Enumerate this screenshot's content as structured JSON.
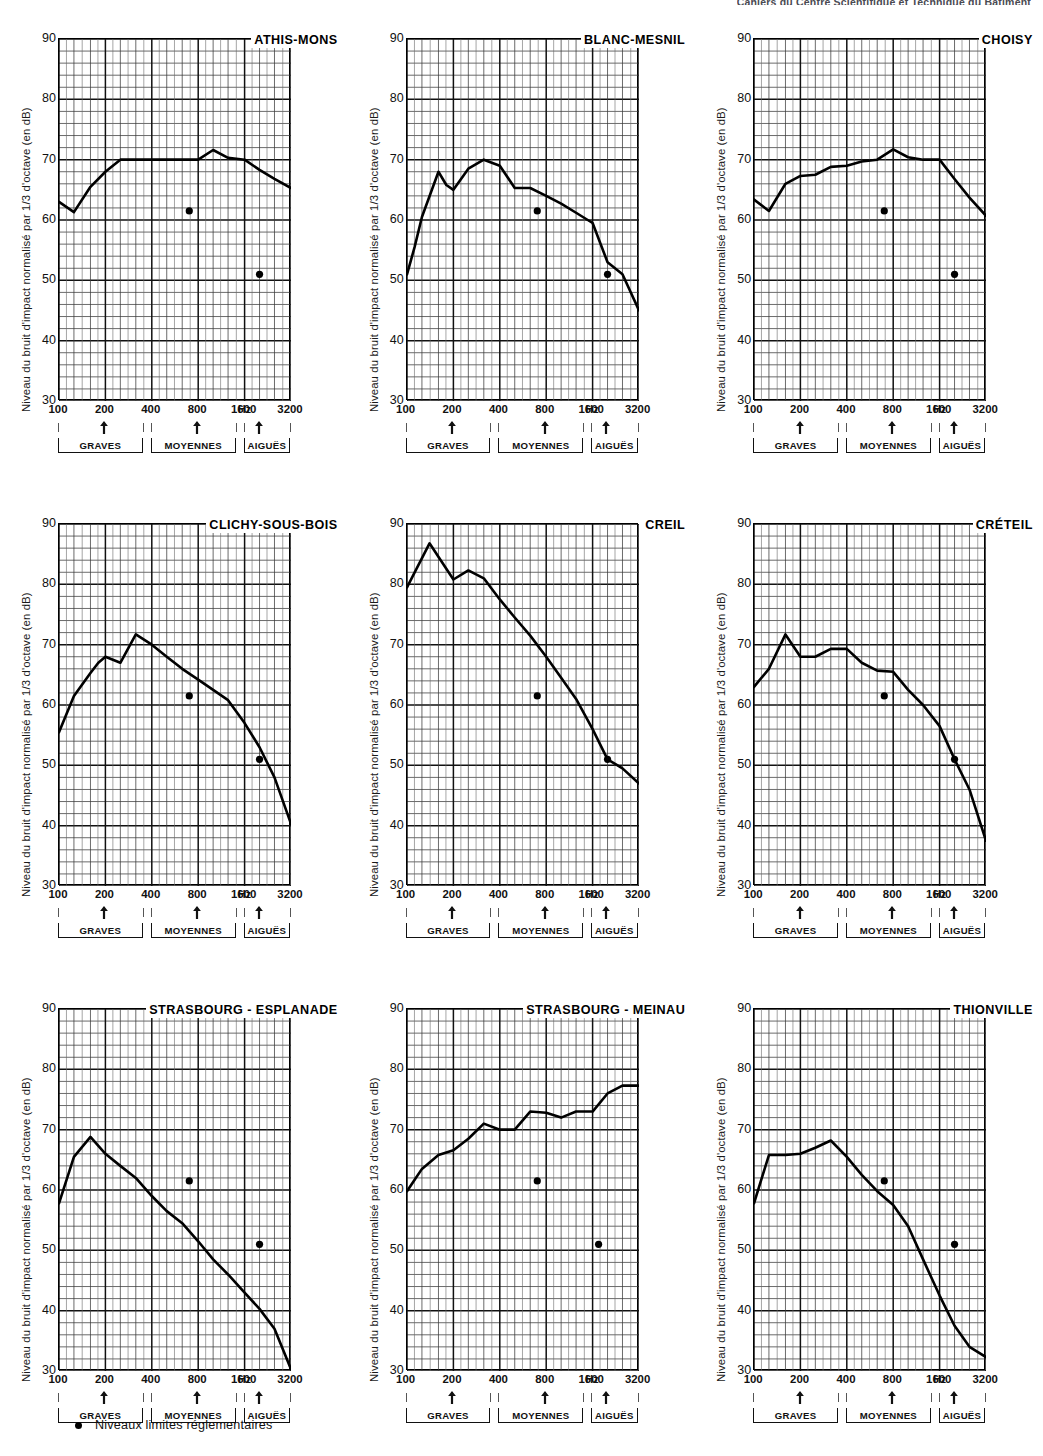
{
  "page": {
    "header_text": "Cahiers du Centre Scientifique et Technique du Bâtiment"
  },
  "axes": {
    "ylabel": "Niveau du bruit d'impact normalisé par 1/3 d'octave (en dB)",
    "yticks": [
      "90",
      "80",
      "70",
      "60",
      "50",
      "40",
      "30"
    ],
    "xticks": [
      "100",
      "200",
      "400",
      "800",
      "1600",
      "3200"
    ],
    "xunit": "Hz",
    "ylim": [
      30,
      90
    ],
    "xlim": [
      100,
      3200
    ]
  },
  "bands": [
    {
      "label": "GRAVES",
      "arrow_hz": 200,
      "start_hz": 100,
      "end_hz": 355
    },
    {
      "label": "MOYENNES",
      "arrow_hz": 800,
      "start_hz": 400,
      "end_hz": 1420
    },
    {
      "label": "AIGUËS",
      "arrow_hz": 2000,
      "start_hz": 1600,
      "end_hz": 3200
    }
  ],
  "legend": {
    "marker": "filled-circle",
    "text": "Niveaux limites réglementaires"
  },
  "chart_data": [
    {
      "type": "line",
      "title": "ATHIS-MONS",
      "xlabel": "",
      "ylabel": "Niveau du bruit d'impact normalisé par 1/3 d'octave (en dB)",
      "xlim": [
        100,
        3200
      ],
      "ylim": [
        30,
        90
      ],
      "x": [
        100,
        125,
        160,
        200,
        250,
        315,
        400,
        500,
        630,
        800,
        1000,
        1250,
        1600,
        2000,
        2500,
        3200
      ],
      "values": [
        63.0,
        61.3,
        65.5,
        68.0,
        70.0,
        70.0,
        70.0,
        70.0,
        70.0,
        70.0,
        71.6,
        70.3,
        70.0,
        68.3,
        66.8,
        65.3
      ],
      "limit_points": [
        {
          "x": 700,
          "y": 61.5
        },
        {
          "x": 2000,
          "y": 51.0
        }
      ]
    },
    {
      "type": "line",
      "title": "BLANC-MESNIL",
      "xlabel": "",
      "ylabel": "Niveau du bruit d'impact normalisé par 1/3 d'octave (en dB)",
      "xlim": [
        100,
        3200
      ],
      "ylim": [
        30,
        90
      ],
      "x": [
        100,
        112,
        125,
        160,
        180,
        200,
        250,
        315,
        400,
        500,
        630,
        800,
        1000,
        1250,
        1600,
        2000,
        2500,
        3200
      ],
      "values": [
        51.0,
        55.5,
        60.5,
        68.0,
        65.8,
        65.0,
        68.5,
        70.0,
        69.0,
        65.3,
        65.3,
        64.0,
        62.7,
        61.2,
        59.5,
        53.0,
        51.0,
        45.0
      ],
      "limit_points": [
        {
          "x": 700,
          "y": 61.5
        },
        {
          "x": 2000,
          "y": 51.0
        }
      ]
    },
    {
      "type": "line",
      "title": "CHOISY",
      "xlabel": "",
      "ylabel": "Niveau du bruit d'impact normalisé par 1/3 d'octave (en dB)",
      "xlim": [
        100,
        3200
      ],
      "ylim": [
        30,
        90
      ],
      "x": [
        100,
        125,
        160,
        200,
        250,
        315,
        400,
        500,
        630,
        800,
        1000,
        1250,
        1600,
        2000,
        2500,
        3200
      ],
      "values": [
        63.4,
        61.5,
        66.0,
        67.3,
        67.5,
        68.8,
        69.0,
        69.7,
        70.0,
        71.7,
        70.4,
        70.0,
        70.0,
        66.8,
        63.7,
        60.7
      ],
      "limit_points": [
        {
          "x": 700,
          "y": 61.5
        },
        {
          "x": 2000,
          "y": 51.0
        }
      ]
    },
    {
      "type": "line",
      "title": "CLICHY-SOUS-BOIS",
      "xlabel": "",
      "ylabel": "Niveau du bruit d'impact normalisé par 1/3 d'octave (en dB)",
      "xlim": [
        100,
        3200
      ],
      "ylim": [
        30,
        90
      ],
      "x": [
        100,
        125,
        160,
        180,
        200,
        250,
        315,
        400,
        500,
        630,
        800,
        1000,
        1250,
        1600,
        2000,
        2500,
        3200
      ],
      "values": [
        55.5,
        61.5,
        65.3,
        67.0,
        68.0,
        67.0,
        71.7,
        70.0,
        68.0,
        66.0,
        64.2,
        62.5,
        60.8,
        57.0,
        53.0,
        48.0,
        40.3
      ],
      "limit_points": [
        {
          "x": 700,
          "y": 61.5
        },
        {
          "x": 2000,
          "y": 51.0
        }
      ]
    },
    {
      "type": "line",
      "title": "CREIL",
      "xlabel": "",
      "ylabel": "Niveau du bruit d'impact normalisé par 1/3 d'octave (en dB)",
      "xlim": [
        100,
        3200
      ],
      "ylim": [
        30,
        90
      ],
      "x": [
        100,
        140,
        200,
        250,
        315,
        400,
        500,
        630,
        800,
        1000,
        1250,
        1600,
        2000,
        2500,
        3200
      ],
      "values": [
        79.5,
        86.8,
        80.8,
        82.3,
        81.0,
        77.5,
        74.5,
        71.5,
        68.0,
        64.5,
        61.0,
        56.0,
        51.0,
        49.5,
        47.0
      ],
      "limit_points": [
        {
          "x": 700,
          "y": 61.5
        },
        {
          "x": 2000,
          "y": 51.0
        }
      ]
    },
    {
      "type": "line",
      "title": "CRÉTEIL",
      "xlabel": "",
      "ylabel": "Niveau du bruit d'impact normalisé par 1/3 d'octave (en dB)",
      "xlim": [
        100,
        3200
      ],
      "ylim": [
        30,
        90
      ],
      "x": [
        100,
        125,
        160,
        200,
        250,
        315,
        400,
        500,
        630,
        800,
        1000,
        1250,
        1600,
        2000,
        2500,
        3200
      ],
      "values": [
        63.0,
        66.0,
        71.7,
        68.0,
        68.0,
        69.3,
        69.3,
        67.0,
        65.7,
        65.5,
        62.5,
        60.0,
        56.5,
        51.0,
        46.0,
        37.5
      ],
      "limit_points": [
        {
          "x": 700,
          "y": 61.5
        },
        {
          "x": 2000,
          "y": 51.0
        }
      ]
    },
    {
      "type": "line",
      "title": "STRASBOURG - ESPLANADE",
      "xlabel": "",
      "ylabel": "Niveau du bruit d'impact normalisé par 1/3 d'octave (en dB)",
      "xlim": [
        100,
        3200
      ],
      "ylim": [
        30,
        90
      ],
      "x": [
        100,
        125,
        160,
        200,
        250,
        315,
        400,
        500,
        630,
        800,
        1000,
        1250,
        1600,
        2000,
        2500,
        3200
      ],
      "values": [
        57.8,
        65.5,
        68.8,
        66.0,
        64.0,
        62.0,
        59.0,
        56.5,
        54.5,
        51.5,
        48.5,
        46.0,
        43.0,
        40.3,
        37.0,
        30.3
      ],
      "limit_points": [
        {
          "x": 700,
          "y": 61.5
        },
        {
          "x": 2000,
          "y": 51.0
        }
      ]
    },
    {
      "type": "line",
      "title": "STRASBOURG - MEINAU",
      "xlabel": "",
      "ylabel": "Niveau du bruit d'impact normalisé par 1/3 d'octave (en dB)",
      "xlim": [
        100,
        3200
      ],
      "ylim": [
        30,
        90
      ],
      "x": [
        100,
        125,
        160,
        200,
        250,
        315,
        400,
        500,
        630,
        800,
        1000,
        1250,
        1600,
        2000,
        2500,
        3200
      ],
      "values": [
        59.8,
        63.5,
        65.8,
        66.6,
        68.5,
        71.0,
        70.0,
        70.0,
        73.0,
        72.8,
        72.0,
        73.0,
        73.0,
        76.0,
        77.3,
        77.3
      ],
      "limit_points": [
        {
          "x": 700,
          "y": 61.5
        },
        {
          "x": 1750,
          "y": 51.0
        }
      ]
    },
    {
      "type": "line",
      "title": "THIONVILLE",
      "xlabel": "",
      "ylabel": "Niveau du bruit d'impact normalisé par 1/3 d'octave (en dB)",
      "xlim": [
        100,
        3200
      ],
      "ylim": [
        30,
        90
      ],
      "x": [
        100,
        125,
        160,
        200,
        250,
        315,
        400,
        500,
        630,
        800,
        1000,
        1250,
        1600,
        2000,
        2500,
        3200
      ],
      "values": [
        57.8,
        65.8,
        65.8,
        66.0,
        67.0,
        68.2,
        65.5,
        62.5,
        59.8,
        57.5,
        54.0,
        48.5,
        42.5,
        37.5,
        34.0,
        32.3
      ],
      "limit_points": [
        {
          "x": 700,
          "y": 61.5
        },
        {
          "x": 2000,
          "y": 51.0
        }
      ]
    }
  ]
}
